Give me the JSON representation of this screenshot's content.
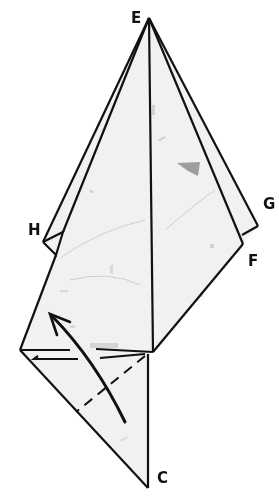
{
  "diagram": {
    "type": "origami-fold-step",
    "labels": {
      "E": "E",
      "G": "G",
      "H": "H",
      "F": "F",
      "C": "C"
    },
    "colors": {
      "paper": "#f1f1f1",
      "line": "#111111",
      "background": "#ffffff",
      "speck": "#8a8a8a"
    },
    "arrow": {
      "direction": "up-left",
      "meaning": "fold flap upward"
    },
    "fold_line": "dashed valley fold across lower triangle"
  }
}
